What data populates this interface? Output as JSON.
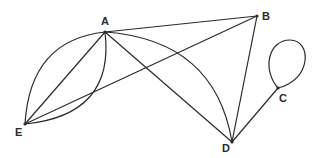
{
  "diagram": {
    "type": "graph",
    "stroke_color": "#2a2a2a",
    "background": "#ffffff",
    "nodes": [
      {
        "id": "A",
        "label": "A",
        "x": 105,
        "y": 32,
        "label_x": 101,
        "label_y": 25
      },
      {
        "id": "B",
        "label": "B",
        "x": 257,
        "y": 16,
        "label_x": 262,
        "label_y": 20
      },
      {
        "id": "C",
        "label": "C",
        "x": 278,
        "y": 88,
        "label_x": 279,
        "label_y": 102
      },
      {
        "id": "D",
        "label": "D",
        "x": 232,
        "y": 142,
        "label_x": 222,
        "label_y": 152
      },
      {
        "id": "E",
        "label": "E",
        "x": 25,
        "y": 124,
        "label_x": 15,
        "label_y": 136
      }
    ],
    "edges": [
      {
        "id": "A-B",
        "from": "A",
        "to": "B",
        "shape": "straight"
      },
      {
        "id": "A-D-line",
        "from": "A",
        "to": "D",
        "shape": "straight"
      },
      {
        "id": "A-D-arc",
        "from": "A",
        "to": "D",
        "shape": "arc"
      },
      {
        "id": "B-D",
        "from": "B",
        "to": "D",
        "shape": "straight"
      },
      {
        "id": "E-B",
        "from": "E",
        "to": "B",
        "shape": "straight"
      },
      {
        "id": "D-C",
        "from": "D",
        "to": "C",
        "shape": "straight"
      },
      {
        "id": "C-loop",
        "from": "C",
        "to": "C",
        "shape": "loop"
      },
      {
        "id": "A-E-outer",
        "from": "A",
        "to": "E",
        "shape": "arc-outer"
      },
      {
        "id": "A-E-line",
        "from": "A",
        "to": "E",
        "shape": "straight"
      },
      {
        "id": "A-E-inner",
        "from": "A",
        "to": "E",
        "shape": "arc-inner"
      }
    ]
  }
}
